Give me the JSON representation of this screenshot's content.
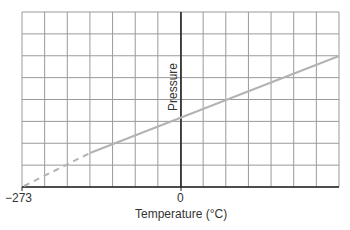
{
  "chart_data": {
    "type": "line",
    "title": "",
    "xlabel": "Temperature (°C)",
    "ylabel": "Pressure",
    "x_tick_labels": [
      "−273",
      "0"
    ],
    "xlim": [
      -273,
      210
    ],
    "grid": true,
    "grid_columns": 14,
    "grid_rows": 8,
    "series": [
      {
        "name": "Pressure vs Temperature",
        "style": "solid",
        "color": "#b3b3b3",
        "x": [
          -153,
          0,
          210
        ],
        "y": [
          1.42,
          2.95,
          5.95
        ]
      },
      {
        "name": "Extrapolation to absolute zero",
        "style": "dashed",
        "color": "#b3b3b3",
        "x": [
          -273,
          -153
        ],
        "y": [
          0,
          1.42
        ]
      }
    ],
    "annotations": [
      "Line extrapolated (dashed) to zero pressure at −273 °C"
    ]
  },
  "labels": {
    "x_min": "−273",
    "x_zero": "0",
    "x_title": "Temperature (°C)",
    "y_title": "Pressure"
  },
  "colors": {
    "grid": "#9a9a9a",
    "axis": "#222222",
    "line": "#b3b3b3"
  }
}
